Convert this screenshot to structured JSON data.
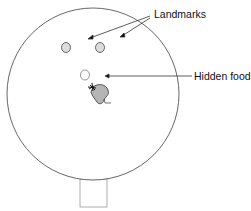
{
  "labels": {
    "landmarks": "Landmarks",
    "hidden_food": "Hidden food"
  },
  "elements": {
    "arena": "circular-arena",
    "start_box": "start-box",
    "landmarks": [
      "landmark-left",
      "landmark-right"
    ],
    "food": "hidden-food-well",
    "animal": "rat"
  },
  "colors": {
    "stroke": "#555555",
    "landmark_fill": "#dcdcdc",
    "rat_fill": "#b5b5b5"
  }
}
